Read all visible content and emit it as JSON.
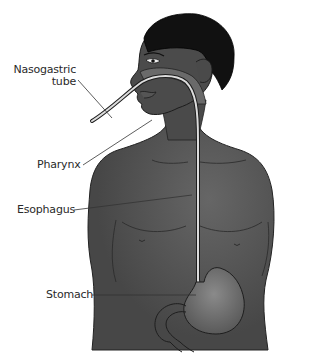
{
  "diagram": {
    "colors": {
      "skin": "#4a4a4a",
      "skin_light": "#5e5e5e",
      "hair": "#111111",
      "stomach": "#6f6f6f",
      "tube": "#d8d8d8",
      "leader": "#333333",
      "text": "#2a2a2a"
    },
    "labels": [
      {
        "id": "nasogastric-tube",
        "line1": "Nasogastric",
        "line2": "tube"
      },
      {
        "id": "pharynx",
        "line1": "Pharynx"
      },
      {
        "id": "esophagus",
        "line1": "Esophagus"
      },
      {
        "id": "stomach",
        "line1": "Stomach"
      }
    ]
  }
}
